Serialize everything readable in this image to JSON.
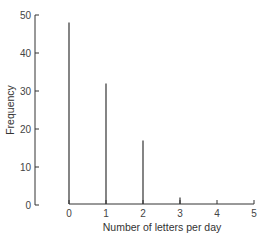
{
  "chart_data": {
    "type": "bar",
    "subtype": "stem",
    "title": "",
    "xlabel": "Number of letters per day",
    "ylabel": "Frequency",
    "categories": [
      "0",
      "1",
      "2",
      "3",
      "4",
      "5"
    ],
    "values": [
      48,
      32,
      17,
      2,
      0,
      0
    ],
    "x_ticks": [
      "0",
      "1",
      "2",
      "3",
      "4",
      "5"
    ],
    "y_ticks": [
      "0",
      "10",
      "20",
      "30",
      "40",
      "50"
    ],
    "xlim": [
      0,
      5
    ],
    "ylim": [
      0,
      50
    ],
    "grid": false,
    "legend": null,
    "colors": {
      "line": "#333333",
      "axis": "#333333"
    }
  }
}
